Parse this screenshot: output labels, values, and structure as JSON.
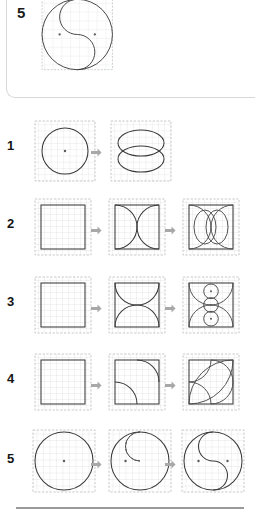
{
  "page": {
    "background_color": "#ffffff",
    "ink_color": "#3a3a3a",
    "grid_color": "#c9cace",
    "arrow_color": "#a8a8a8",
    "rule_color": "#9a9a9a"
  },
  "featured_panel": {
    "number": "5",
    "figure_name": "yin-yang-final",
    "description": "Large circle containing an S-curve formed by two half-circles, with two centre dots",
    "grid_units": 8
  },
  "arrow": {
    "glyph": "➡",
    "name": "step-arrow-icon"
  },
  "rows": [
    {
      "number": "1",
      "steps": [
        {
          "name": "circle-in-grid",
          "caption": "Circle inscribed in grid square",
          "dots": 1
        },
        {
          "name": "two-overlapping-ellipses",
          "caption": "Two overlapping horizontal ellipses",
          "dots": 0
        }
      ]
    },
    {
      "number": "2",
      "steps": [
        {
          "name": "plain-square",
          "caption": "Plain square",
          "dots": 0
        },
        {
          "name": "square-with-side-arcs",
          "caption": "Square with two inward arcs from left and right sides",
          "dots": 0
        },
        {
          "name": "square-arcs-plus-ellipses",
          "caption": "Square with arcs and two overlapping vertical ellipses",
          "dots": 0
        }
      ]
    },
    {
      "number": "3",
      "steps": [
        {
          "name": "plain-square",
          "caption": "Plain square",
          "dots": 0
        },
        {
          "name": "square-with-top-bottom-arcs",
          "caption": "Square with two inward arcs from top and bottom",
          "dots": 0
        },
        {
          "name": "square-arcs-plus-three-circles",
          "caption": "Square with arcs and three stacked circles",
          "dots": 3
        }
      ]
    },
    {
      "number": "4",
      "steps": [
        {
          "name": "plain-square",
          "caption": "Plain square",
          "dots": 0
        },
        {
          "name": "square-with-two-quarter-arcs",
          "caption": "Square with quarter arcs at top-right and bottom-left",
          "dots": 0
        },
        {
          "name": "square-leaf-lens",
          "caption": "Square with leaf shape formed by crossing arcs",
          "dots": 0
        }
      ]
    },
    {
      "number": "5",
      "steps": [
        {
          "name": "large-circle",
          "caption": "Large circle with centre dot",
          "dots": 1
        },
        {
          "name": "circle-with-inner-dashed-circle",
          "caption": "Large circle with smaller inner circle, lower half dashed",
          "dots": 1
        },
        {
          "name": "yin-yang-s-curve",
          "caption": "Large circle divided by an S-curve, two centre dots",
          "dots": 2
        }
      ]
    }
  ]
}
